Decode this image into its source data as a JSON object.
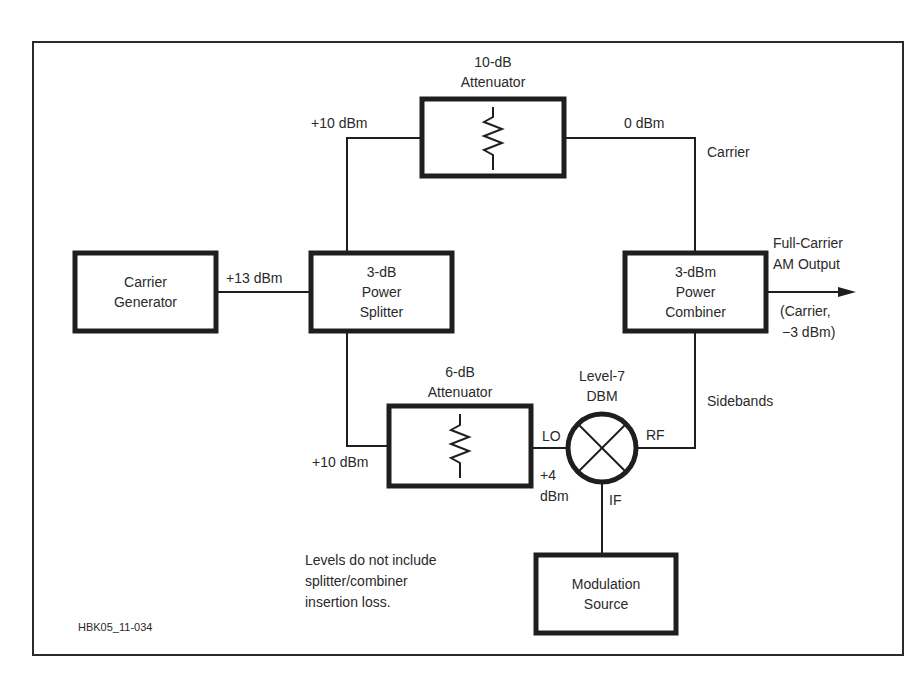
{
  "diagram": {
    "figure_id": "HBK05_11-034",
    "note": [
      "Levels do not include",
      "splitter/combiner",
      "insertion loss."
    ],
    "blocks": {
      "carrier_generator": [
        "Carrier",
        "Generator"
      ],
      "power_splitter": [
        "3-dB",
        "Power",
        "Splitter"
      ],
      "attenuator_10db": [
        "10-dB",
        "Attenuator"
      ],
      "power_combiner": [
        "3-dBm",
        "Power",
        "Combiner"
      ],
      "attenuator_6db": [
        "6-dB",
        "Attenuator"
      ],
      "mixer": [
        "Level-7",
        "DBM"
      ],
      "modulation_source": [
        "Modulation",
        "Source"
      ]
    },
    "ports": {
      "lo": "LO",
      "rf": "RF",
      "if": "IF"
    },
    "levels": {
      "generator_out": "+13 dBm",
      "splitter_top": "+10 dBm",
      "splitter_bottom": "+10 dBm",
      "attenuator_10_out": "0 dBm",
      "lo_level": [
        "+4",
        "dBm"
      ]
    },
    "signal_labels": {
      "carrier": "Carrier",
      "sidebands": "Sidebands",
      "output_title": [
        "Full-Carrier",
        "AM Output"
      ],
      "output_detail": [
        "(Carrier,",
        "−3 dBm)"
      ]
    },
    "colors": {
      "line": "#222222",
      "background": "#ffffff"
    }
  }
}
